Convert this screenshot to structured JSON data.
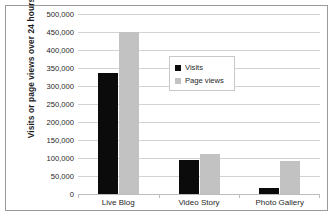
{
  "chart_data": {
    "type": "bar",
    "title": "",
    "xlabel": "",
    "ylabel": "Visits or page views over 24 hours",
    "categories": [
      "Live Blog",
      "Video Story",
      "Photo Gallery"
    ],
    "series": [
      {
        "name": "Visits",
        "color": "#0b0b0b",
        "values": [
          335000,
          95000,
          18000
        ]
      },
      {
        "name": "Page views",
        "color": "#c2c2c2",
        "values": [
          450000,
          112000,
          92000
        ]
      }
    ],
    "ylim": [
      0,
      500000
    ],
    "ytick_step": 50000,
    "ytick_labels": [
      "500,000",
      "450,000",
      "400,000",
      "350,000",
      "300,000",
      "250,000",
      "200,000",
      "150,000",
      "100,000",
      "50,000",
      "0"
    ],
    "ytick_values": [
      500000,
      450000,
      400000,
      350000,
      300000,
      250000,
      200000,
      150000,
      100000,
      50000,
      0
    ],
    "grid": true,
    "legend_position": "inside-upper-center",
    "legend_entries": [
      "Visits",
      "Page views"
    ],
    "border": true
  }
}
